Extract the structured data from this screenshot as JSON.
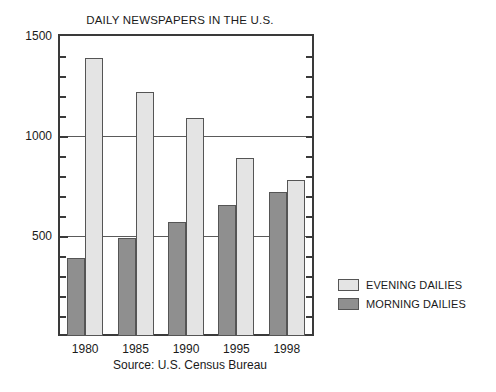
{
  "chart_data": {
    "type": "bar",
    "title": "DAILY NEWSPAPERS IN THE U.S.",
    "subtitle": "",
    "xlabel": "",
    "ylabel": "",
    "categories": [
      "1980",
      "1985",
      "1990",
      "1995",
      "1998"
    ],
    "series": [
      {
        "name": "EVENING DAILIES",
        "color": "#e4e4e4",
        "values": [
          1390,
          1220,
          1090,
          890,
          781
        ]
      },
      {
        "name": "MORNING DAILIES",
        "color": "#8f8f8f",
        "values": [
          390,
          490,
          570,
          655,
          721
        ]
      }
    ],
    "ylim": [
      0,
      1500
    ],
    "ytick_labels": [
      "500",
      "1000",
      "1500"
    ],
    "ytick_values": [
      500,
      1000,
      1500
    ],
    "yminor_step": 100,
    "gridlines": [
      500,
      1000
    ],
    "grid": true,
    "legend_position": "right",
    "annotations": [
      "Source: U.S. Census Bureau"
    ]
  },
  "caption": {
    "source": "Source: U.S. Census Bureau"
  },
  "legend": {
    "entries": [
      {
        "label": "EVENING DAILIES",
        "swatch": "evening"
      },
      {
        "label": "MORNING DAILIES",
        "swatch": "morning"
      }
    ]
  }
}
